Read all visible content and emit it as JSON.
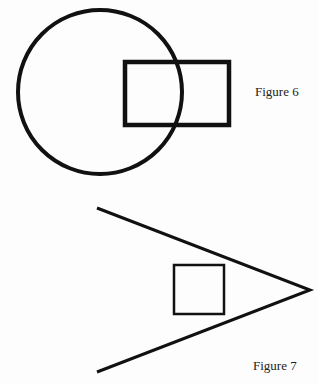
{
  "figures": [
    {
      "caption": "Figure 6",
      "shapes": {
        "circle": {
          "cx": 100,
          "cy": 92,
          "r": 82
        },
        "rectangle": {
          "x": 124,
          "y": 61,
          "width": 105,
          "height": 64
        }
      }
    },
    {
      "caption": "Figure 7",
      "shapes": {
        "angle_lines": {
          "apex": [
            310,
            290
          ],
          "upper_end": [
            97,
            208
          ],
          "lower_end": [
            97,
            372
          ]
        },
        "square": {
          "x": 174,
          "y": 265,
          "width": 50,
          "height": 49
        }
      }
    }
  ],
  "colors": {
    "stroke": "#111111",
    "background": "#fdfdfd"
  }
}
